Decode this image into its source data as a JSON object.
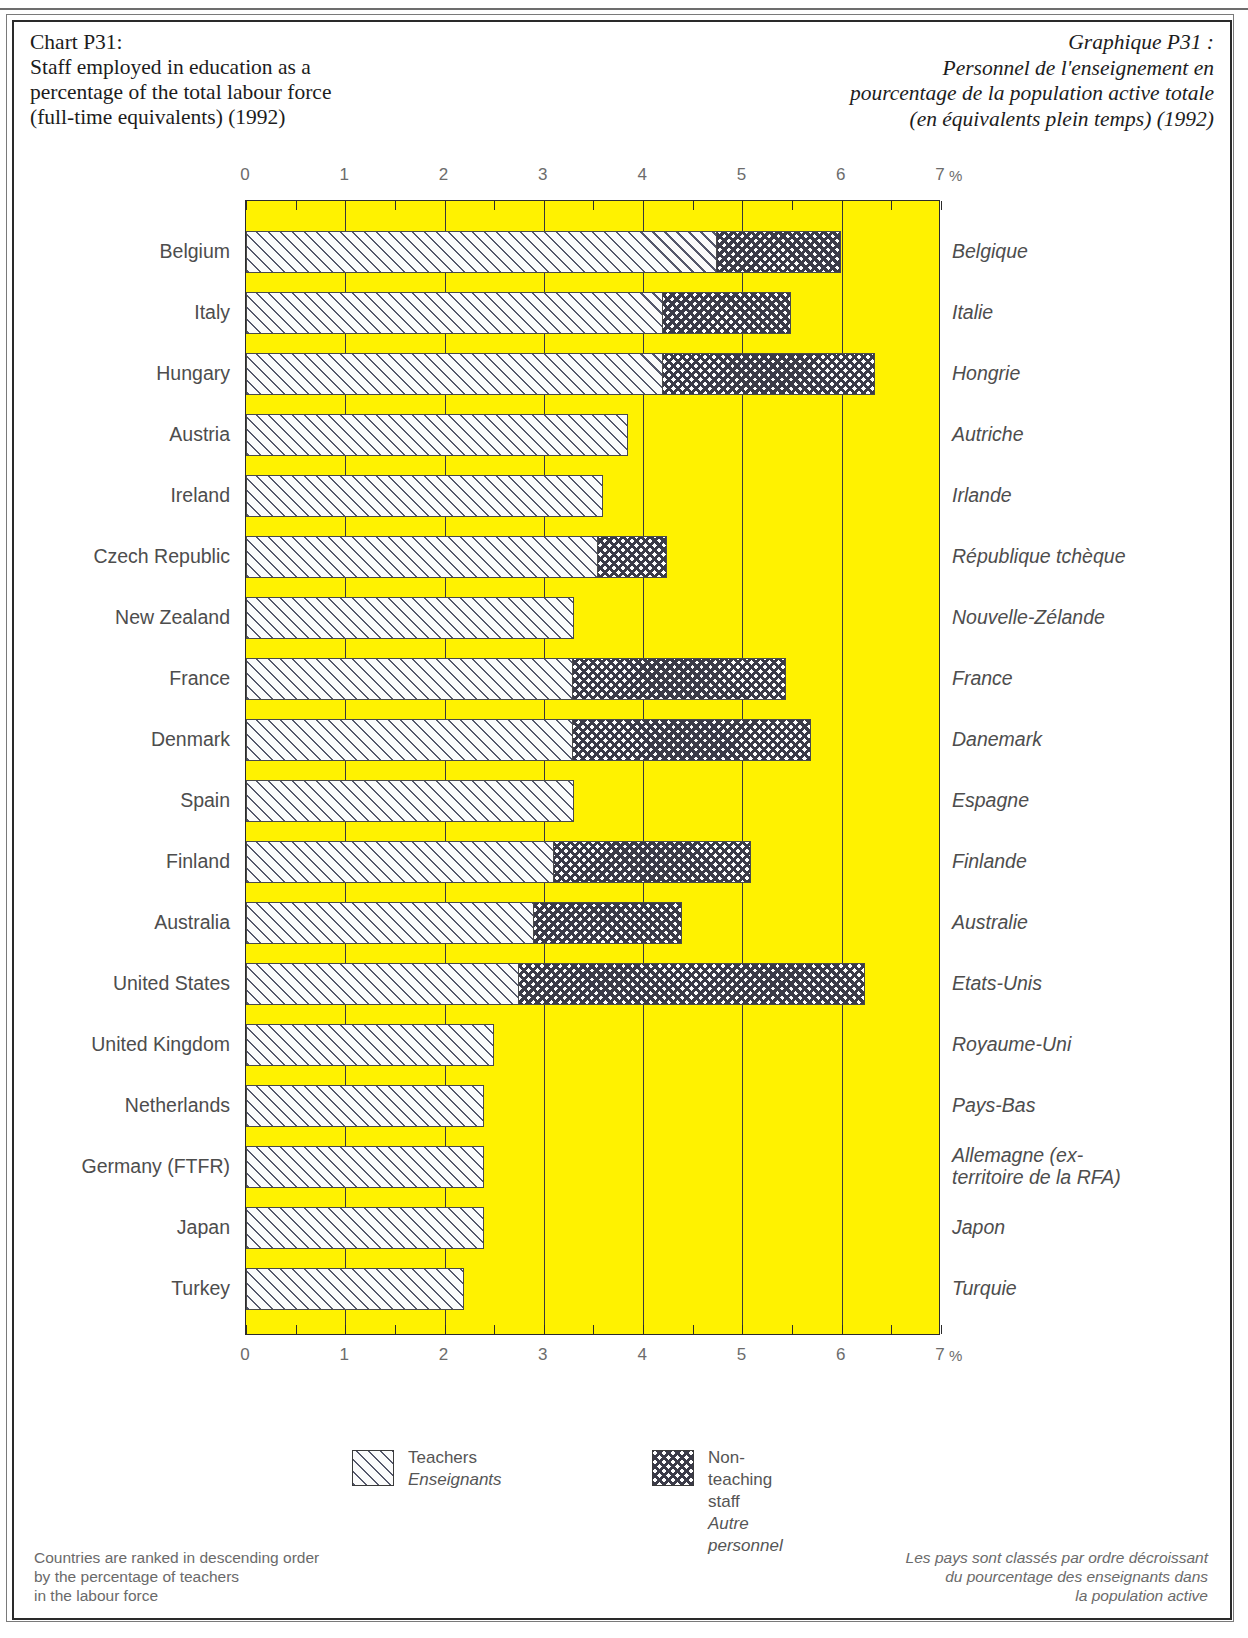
{
  "header": {
    "title_en_lines": [
      "Chart P31:",
      "Staff employed in education as a",
      "percentage of the total labour force",
      "(full-time equivalents) (1992)"
    ],
    "title_fr_lines": [
      "Graphique P31 :",
      "Personnel de l'enseignement en",
      "pourcentage de la population active totale",
      "(en équivalents plein temps) (1992)"
    ]
  },
  "axis": {
    "ticks": [
      "0",
      "1",
      "2",
      "3",
      "4",
      "5",
      "6",
      "7"
    ],
    "unit": "%",
    "min": 0,
    "max": 7
  },
  "legend": {
    "teachers_en": "Teachers",
    "teachers_fr": "Enseignants",
    "other_en": "Non-teaching staff",
    "other_fr": "Autre personnel"
  },
  "notes": {
    "en_lines": [
      "Countries are ranked in descending order",
      "by the percentage of teachers",
      "in the labour force"
    ],
    "fr_lines": [
      "Les pays sont classés par ordre décroissant",
      "du pourcentage des enseignants dans",
      "la population active"
    ]
  },
  "colors": {
    "plot_background": "#fff200",
    "frame": "#2a2a2a",
    "label_text": "#4d4d4d",
    "hatch": "#55586b"
  },
  "chart_data": {
    "type": "bar",
    "orientation": "horizontal",
    "stacked": true,
    "xlabel": "%",
    "ylabel": "",
    "xlim": [
      0,
      7
    ],
    "grid": true,
    "legend_position": "bottom",
    "categories": [
      "Belgium",
      "Italy",
      "Hungary",
      "Austria",
      "Ireland",
      "Czech Republic",
      "New Zealand",
      "France",
      "Denmark",
      "Spain",
      "Finland",
      "Australia",
      "United States",
      "United Kingdom",
      "Netherlands",
      "Germany (FTFR)",
      "Japan",
      "Turkey"
    ],
    "categories_fr": [
      "Belgique",
      "Italie",
      "Hongrie",
      "Autriche",
      "Irlande",
      "République tchèque",
      "Nouvelle-Zélande",
      "France",
      "Danemark",
      "Espagne",
      "Finlande",
      "Australie",
      "Etats-Unis",
      "Royaume-Uni",
      "Pays-Bas",
      "Allemagne (ex-territoire de la RFA)",
      "Japon",
      "Turquie"
    ],
    "series": [
      {
        "name": "Teachers",
        "name_fr": "Enseignants",
        "values": [
          4.75,
          4.2,
          4.2,
          3.85,
          3.6,
          3.55,
          3.3,
          3.3,
          3.3,
          3.3,
          3.1,
          2.9,
          2.75,
          2.5,
          2.4,
          2.4,
          2.4,
          2.2
        ]
      },
      {
        "name": "Non-teaching staff",
        "name_fr": "Autre personnel",
        "values": [
          1.25,
          1.3,
          2.15,
          0,
          0,
          0.7,
          0,
          2.15,
          2.4,
          0,
          2.0,
          1.5,
          3.5,
          0,
          0,
          0,
          0,
          0
        ]
      }
    ],
    "totals": [
      6.0,
      5.5,
      6.35,
      3.85,
      3.6,
      4.25,
      3.3,
      5.45,
      5.7,
      3.3,
      5.1,
      4.4,
      6.25,
      2.5,
      2.4,
      2.4,
      2.4,
      2.2
    ]
  },
  "rows": [
    {
      "en": "Belgium",
      "fr": "Belgique"
    },
    {
      "en": "Italy",
      "fr": "Italie"
    },
    {
      "en": "Hungary",
      "fr": "Hongrie"
    },
    {
      "en": "Austria",
      "fr": "Autriche"
    },
    {
      "en": "Ireland",
      "fr": "Irlande"
    },
    {
      "en": "Czech Republic",
      "fr": "République tchèque"
    },
    {
      "en": "New Zealand",
      "fr": "Nouvelle-Zélande"
    },
    {
      "en": "France",
      "fr": "France"
    },
    {
      "en": "Denmark",
      "fr": "Danemark"
    },
    {
      "en": "Spain",
      "fr": "Espagne"
    },
    {
      "en": "Finland",
      "fr": "Finlande"
    },
    {
      "en": "Australia",
      "fr": "Australie"
    },
    {
      "en": "United States",
      "fr": "Etats-Unis"
    },
    {
      "en": "United Kingdom",
      "fr": "Royaume-Uni"
    },
    {
      "en": "Netherlands",
      "fr": "Pays-Bas"
    },
    {
      "en": "Germany (FTFR)",
      "fr": "Allemagne (ex-\nterritoire de la RFA)"
    },
    {
      "en": "Japan",
      "fr": "Japon"
    },
    {
      "en": "Turkey",
      "fr": "Turquie"
    }
  ]
}
